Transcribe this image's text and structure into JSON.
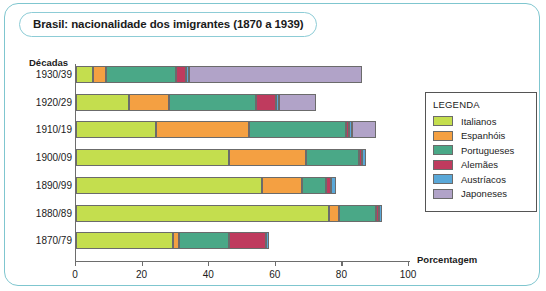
{
  "chart_data": {
    "type": "bar",
    "orientation": "horizontal",
    "stacked": true,
    "title": "Brasil: nacionalidade dos imigrantes (1870 a 1939)",
    "xlabel": "Porcentagem",
    "ylabel": "Décadas",
    "xlim": [
      0,
      100
    ],
    "xticks": [
      0,
      20,
      40,
      60,
      80,
      100
    ],
    "grid": false,
    "legend_title": "LEGENDA",
    "legend_position": "right",
    "categories": [
      "1930/39",
      "1920/29",
      "1910/19",
      "1900/09",
      "1890/99",
      "1880/89",
      "1870/79"
    ],
    "series": [
      {
        "name": "Italianos",
        "color": "#c4de4e",
        "values": [
          5,
          16,
          24,
          46,
          56,
          76,
          29
        ]
      },
      {
        "name": "Espanhóis",
        "color": "#f4a042",
        "values": [
          4,
          12,
          28,
          23,
          12,
          3,
          2
        ]
      },
      {
        "name": "Portugueses",
        "color": "#4aa887",
        "values": [
          21,
          26,
          29,
          16,
          7,
          11,
          15
        ]
      },
      {
        "name": "Alemães",
        "color": "#bf3b5e",
        "values": [
          3,
          6,
          1,
          1,
          1.5,
          1,
          11
        ]
      },
      {
        "name": "Austríacos",
        "color": "#5aa8d8",
        "values": [
          1,
          1,
          1,
          1,
          1.5,
          1,
          1
        ]
      },
      {
        "name": "Japoneses",
        "color": "#b1a3c8",
        "values": [
          52,
          11,
          7,
          0,
          0,
          0,
          0
        ]
      }
    ],
    "totals": [
      86,
      72,
      90,
      87,
      78,
      92,
      58
    ]
  }
}
